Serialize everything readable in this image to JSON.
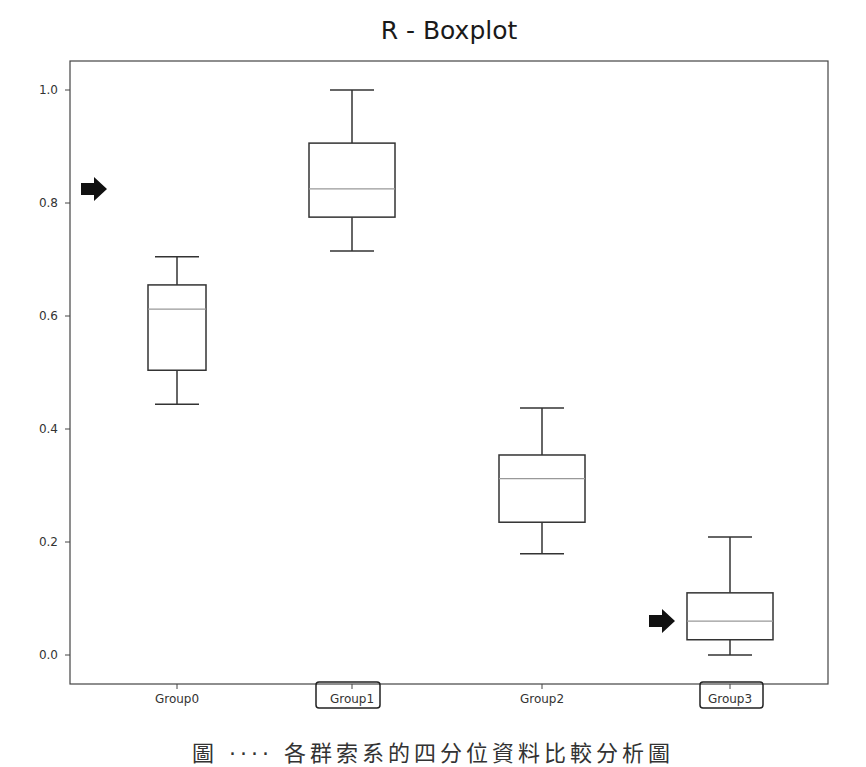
{
  "chart_data": {
    "type": "box",
    "title": "R - Boxplot",
    "xlabel": "",
    "ylabel": "",
    "ylim": [
      -0.05,
      1.05
    ],
    "yticks": [
      0.0,
      0.2,
      0.4,
      0.6,
      0.8,
      1.0
    ],
    "ytick_labels": [
      "0.0",
      "0.2",
      "0.4",
      "0.6",
      "0.8",
      "1.0"
    ],
    "categories": [
      "Group0",
      "Group1",
      "Group2",
      "Group3"
    ],
    "grid": false,
    "legend": null,
    "series": [
      {
        "name": "Group0",
        "whisker_low": 0.444,
        "q1": 0.504,
        "median": 0.612,
        "q3": 0.655,
        "whisker_high": 0.705
      },
      {
        "name": "Group1",
        "whisker_low": 0.715,
        "q1": 0.775,
        "median": 0.825,
        "q3": 0.906,
        "whisker_high": 1.0
      },
      {
        "name": "Group2",
        "whisker_low": 0.179,
        "q1": 0.235,
        "median": 0.312,
        "q3": 0.354,
        "whisker_high": 0.437
      },
      {
        "name": "Group3",
        "whisker_low": 0.0,
        "q1": 0.027,
        "median": 0.06,
        "q3": 0.11,
        "whisker_high": 0.209
      }
    ],
    "annotations": [
      {
        "type": "arrow",
        "points_to": "y-axis near 0.8 (Group1 median level)",
        "y": 0.825
      },
      {
        "type": "arrow",
        "points_to": "Group3 median",
        "y": 0.06
      },
      {
        "type": "highlight-box",
        "target": "Group1 x-tick label"
      },
      {
        "type": "highlight-box",
        "target": "Group3 x-tick label"
      }
    ]
  },
  "colors": {
    "box_edge": "#333333",
    "median_line": "#999999",
    "axis": "#444444",
    "arrow": "#111111"
  },
  "caption": "圖 ‧‧‧‧ 各群索系的四分位資料比較分析圖"
}
